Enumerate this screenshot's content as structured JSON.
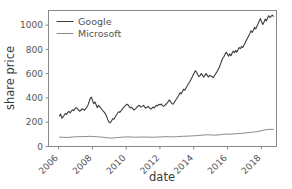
{
  "chart_data": {
    "type": "line",
    "title": "",
    "xlabel": "date",
    "ylabel": "share price",
    "xlim": [
      2005.4,
      2018.9
    ],
    "ylim": [
      -55,
      1120
    ],
    "xticks": [
      "2006",
      "2008",
      "2010",
      "2012",
      "2014",
      "2016",
      "2018"
    ],
    "xtick_values": [
      2006,
      2008,
      2010,
      2012,
      2014,
      2016,
      2018
    ],
    "yticks": [
      "0",
      "200",
      "400",
      "600",
      "800",
      "1000"
    ],
    "ytick_values": [
      0,
      200,
      400,
      600,
      800,
      1000
    ],
    "grid": false,
    "legend_position": "upper left",
    "xtick_rotation": -45,
    "series": [
      {
        "name": "Google",
        "color": "#3b3b3b",
        "linewidth": 1.1,
        "x": [
          2006.05,
          2006.12,
          2006.19,
          2006.26,
          2006.33,
          2006.4,
          2006.47,
          2006.54,
          2006.61,
          2006.68,
          2006.75,
          2006.82,
          2006.89,
          2006.96,
          2007.03,
          2007.1,
          2007.17,
          2007.24,
          2007.31,
          2007.38,
          2007.45,
          2007.52,
          2007.59,
          2007.66,
          2007.73,
          2007.8,
          2007.87,
          2007.94,
          2008.01,
          2008.08,
          2008.15,
          2008.22,
          2008.29,
          2008.36,
          2008.43,
          2008.5,
          2008.57,
          2008.64,
          2008.71,
          2008.78,
          2008.85,
          2008.92,
          2008.99,
          2009.06,
          2009.13,
          2009.2,
          2009.27,
          2009.34,
          2009.41,
          2009.48,
          2009.55,
          2009.62,
          2009.69,
          2009.76,
          2009.83,
          2009.9,
          2009.97,
          2010.04,
          2010.11,
          2010.18,
          2010.25,
          2010.32,
          2010.39,
          2010.46,
          2010.53,
          2010.6,
          2010.67,
          2010.74,
          2010.81,
          2010.88,
          2010.95,
          2011.02,
          2011.09,
          2011.16,
          2011.23,
          2011.3,
          2011.37,
          2011.44,
          2011.51,
          2011.58,
          2011.65,
          2011.72,
          2011.79,
          2011.86,
          2011.93,
          2012.0,
          2012.07,
          2012.14,
          2012.21,
          2012.28,
          2012.35,
          2012.42,
          2012.49,
          2012.56,
          2012.63,
          2012.7,
          2012.77,
          2012.84,
          2012.91,
          2012.98,
          2013.05,
          2013.12,
          2013.19,
          2013.26,
          2013.33,
          2013.4,
          2013.47,
          2013.54,
          2013.61,
          2013.68,
          2013.75,
          2013.82,
          2013.89,
          2013.96,
          2014.03,
          2014.1,
          2014.17,
          2014.24,
          2014.31,
          2014.38,
          2014.45,
          2014.52,
          2014.59,
          2014.66,
          2014.73,
          2014.8,
          2014.87,
          2014.94,
          2015.01,
          2015.08,
          2015.15,
          2015.22,
          2015.29,
          2015.36,
          2015.43,
          2015.5,
          2015.57,
          2015.64,
          2015.71,
          2015.78,
          2015.85,
          2015.92,
          2015.99,
          2016.06,
          2016.13,
          2016.2,
          2016.27,
          2016.34,
          2016.41,
          2016.48,
          2016.55,
          2016.62,
          2016.69,
          2016.76,
          2016.83,
          2016.9,
          2016.97,
          2017.04,
          2017.11,
          2017.18,
          2017.25,
          2017.32,
          2017.39,
          2017.46,
          2017.53,
          2017.6,
          2017.67,
          2017.74,
          2017.81,
          2017.88,
          2017.95,
          2018.02,
          2018.09,
          2018.16,
          2018.23,
          2018.3,
          2018.37,
          2018.44,
          2018.51,
          2018.58,
          2018.65,
          2018.72
        ],
        "y": [
          210,
          225,
          190,
          200,
          215,
          230,
          222,
          240,
          248,
          236,
          250,
          262,
          255,
          268,
          280,
          275,
          262,
          250,
          258,
          270,
          266,
          258,
          270,
          282,
          300,
          330,
          360,
          372,
          340,
          315,
          330,
          305,
          280,
          300,
          290,
          275,
          265,
          250,
          240,
          225,
          200,
          175,
          155,
          150,
          165,
          185,
          180,
          198,
          215,
          230,
          245,
          240,
          252,
          266,
          280,
          292,
          300,
          310,
          305,
          290,
          278,
          284,
          272,
          260,
          268,
          278,
          290,
          300,
          296,
          285,
          292,
          300,
          288,
          276,
          284,
          292,
          280,
          268,
          274,
          286,
          278,
          290,
          300,
          296,
          310,
          305,
          312,
          300,
          292,
          300,
          310,
          320,
          334,
          348,
          330,
          318,
          310,
          324,
          340,
          355,
          372,
          390,
          410,
          400,
          420,
          440,
          432,
          450,
          468,
          485,
          500,
          520,
          540,
          560,
          580,
          600,
          585,
          565,
          548,
          560,
          575,
          560,
          545,
          560,
          575,
          560,
          545,
          560,
          555,
          548,
          540,
          556,
          572,
          588,
          605,
          625,
          650,
          680,
          705,
          720,
          740,
          760,
          745,
          725,
          745,
          730,
          750,
          770,
          755,
          775,
          760,
          780,
          800,
          790,
          810,
          800,
          820,
          840,
          860,
          880,
          900,
          920,
          945,
          930,
          950,
          975,
          960,
          985,
          1005,
          1030,
          1050,
          1020,
          1000,
          1020,
          1045,
          1030,
          1055,
          1075,
          1060,
          1070,
          1080,
          1070
        ]
      },
      {
        "name": "Microsoft",
        "color": "#8a8a8a",
        "linewidth": 1.0,
        "x": [
          2006.05,
          2006.3,
          2006.55,
          2006.8,
          2007.05,
          2007.3,
          2007.55,
          2007.8,
          2008.05,
          2008.3,
          2008.55,
          2008.8,
          2009.05,
          2009.3,
          2009.55,
          2009.8,
          2010.05,
          2010.3,
          2010.55,
          2010.8,
          2011.05,
          2011.3,
          2011.55,
          2011.8,
          2012.05,
          2012.3,
          2012.55,
          2012.8,
          2013.05,
          2013.3,
          2013.55,
          2013.8,
          2014.05,
          2014.3,
          2014.55,
          2014.8,
          2015.05,
          2015.3,
          2015.55,
          2015.8,
          2016.05,
          2016.3,
          2016.55,
          2016.8,
          2017.05,
          2017.3,
          2017.55,
          2017.8,
          2018.05,
          2018.3,
          2018.55,
          2018.72
        ],
        "y": [
          26,
          24,
          23,
          27,
          29,
          30,
          31,
          33,
          31,
          29,
          26,
          22,
          18,
          20,
          23,
          26,
          28,
          27,
          25,
          26,
          27,
          26,
          25,
          26,
          28,
          30,
          29,
          28,
          30,
          33,
          34,
          36,
          38,
          40,
          44,
          46,
          45,
          43,
          46,
          52,
          52,
          53,
          56,
          58,
          62,
          66,
          70,
          74,
          84,
          90,
          94,
          92
        ]
      }
    ]
  },
  "axes": {
    "y_label": "share price",
    "x_label": "date",
    "y_tick_labels": [
      "1000",
      "800",
      "600",
      "400",
      "200",
      "0"
    ],
    "x_tick_labels": [
      "2006",
      "2008",
      "2010",
      "2012",
      "2014",
      "2016",
      "2018"
    ]
  },
  "legend": {
    "entries": [
      {
        "label": "Google",
        "color": "#3b3b3b"
      },
      {
        "label": "Microsoft",
        "color": "#8a8a8a"
      }
    ]
  }
}
